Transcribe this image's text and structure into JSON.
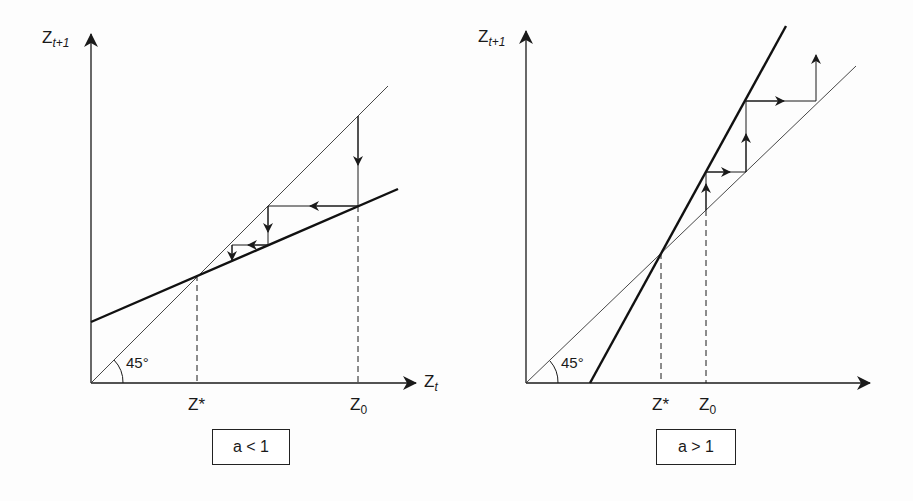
{
  "panels": [
    {
      "id": "left",
      "y_axis_label": "Z",
      "y_axis_sub": "t+1",
      "x_axis_label": "Z",
      "x_axis_sub": "t",
      "angle_label": "45°",
      "equilibrium_label": "Z*",
      "initial_label": "Z",
      "initial_sub": "0",
      "condition": "a < 1",
      "behavior": "converging"
    },
    {
      "id": "right",
      "y_axis_label": "Z",
      "y_axis_sub": "t+1",
      "angle_label": "45°",
      "equilibrium_label": "Z*",
      "initial_label": "Z",
      "initial_sub": "0",
      "condition": "a > 1",
      "behavior": "diverging"
    }
  ],
  "colors": {
    "line": "#1a1a1a",
    "background": "#fdfdfd"
  }
}
